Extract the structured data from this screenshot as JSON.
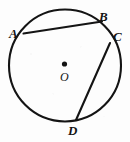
{
  "figure": {
    "background_color": "#fdfdfd",
    "stroke_color": "#141414",
    "canvas": {
      "width": 130,
      "height": 142
    }
  },
  "circle": {
    "center_x": 65,
    "center_y": 65.5,
    "radius": 56,
    "stroke_width": 2.1
  },
  "center_point": {
    "label": "O",
    "dot_x": 64.5,
    "dot_y": 64,
    "dot_radius": 2.6,
    "label_x": 60,
    "label_y": 71
  },
  "vertices": [
    {
      "id": "A",
      "label": "A",
      "point_x": 23.5,
      "point_y": 33.5,
      "label_x": 9,
      "label_y": 27
    },
    {
      "id": "B",
      "label": "B",
      "point_x": 102,
      "point_y": 21.5,
      "label_x": 99,
      "label_y": 10
    },
    {
      "id": "C",
      "label": "C",
      "point_x": 110,
      "point_y": 43,
      "label_x": 113,
      "label_y": 30
    },
    {
      "id": "D",
      "label": "D",
      "point_x": 76,
      "point_y": 120,
      "label_x": 68,
      "label_y": 124
    }
  ],
  "chords": [
    {
      "id": "AB",
      "from": "A",
      "to": "B",
      "x1": 23.5,
      "y1": 33.5,
      "x2": 102,
      "y2": 21.5,
      "stroke_width": 2.1
    },
    {
      "id": "CD",
      "from": "C",
      "to": "D",
      "x1": 110,
      "y1": 43,
      "x2": 76,
      "y2": 120,
      "stroke_width": 2.1
    }
  ]
}
